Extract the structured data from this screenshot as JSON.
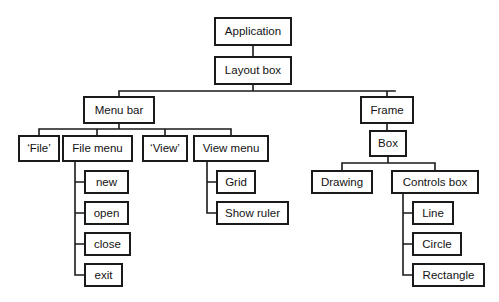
{
  "diagram": {
    "type": "tree-diagram",
    "style": {
      "background": "#ffffff",
      "box_fill": "#ffffff",
      "box_stroke": "#1a1a1a",
      "text_color": "#121212",
      "connector_color": "#1a1a1a"
    },
    "nodes": [
      {
        "id": "application",
        "label": "Application",
        "x": 215,
        "y": 18,
        "w": 76,
        "h": 27
      },
      {
        "id": "layout_box",
        "label": "Layout box",
        "x": 215,
        "y": 57,
        "w": 76,
        "h": 27
      },
      {
        "id": "menu_bar",
        "label": "Menu bar",
        "x": 84,
        "y": 97,
        "w": 70,
        "h": 26
      },
      {
        "id": "frame",
        "label": "Frame",
        "x": 361,
        "y": 97,
        "w": 52,
        "h": 26
      },
      {
        "id": "file_literal",
        "label": "‘File’",
        "x": 19,
        "y": 136,
        "w": 40,
        "h": 25
      },
      {
        "id": "file_menu",
        "label": "File menu",
        "x": 63,
        "y": 136,
        "w": 69,
        "h": 25
      },
      {
        "id": "view_literal",
        "label": "‘View’",
        "x": 143,
        "y": 136,
        "w": 44,
        "h": 25
      },
      {
        "id": "view_menu",
        "label": "View menu",
        "x": 194,
        "y": 136,
        "w": 74,
        "h": 25
      },
      {
        "id": "box",
        "label": "Box",
        "x": 370,
        "y": 131,
        "w": 36,
        "h": 25
      },
      {
        "id": "new",
        "label": "new",
        "x": 85,
        "y": 171,
        "w": 43,
        "h": 22
      },
      {
        "id": "open",
        "label": "open",
        "x": 85,
        "y": 202,
        "w": 43,
        "h": 22
      },
      {
        "id": "close",
        "label": "close",
        "x": 85,
        "y": 233,
        "w": 45,
        "h": 22
      },
      {
        "id": "exit",
        "label": "exit",
        "x": 85,
        "y": 264,
        "w": 37,
        "h": 22
      },
      {
        "id": "grid",
        "label": "Grid",
        "x": 217,
        "y": 171,
        "w": 38,
        "h": 22
      },
      {
        "id": "show_ruler",
        "label": "Show ruler",
        "x": 217,
        "y": 202,
        "w": 71,
        "h": 22
      },
      {
        "id": "drawing",
        "label": "Drawing",
        "x": 312,
        "y": 171,
        "w": 60,
        "h": 22
      },
      {
        "id": "controls_box",
        "label": "Controls box",
        "x": 392,
        "y": 171,
        "w": 86,
        "h": 22
      },
      {
        "id": "line",
        "label": "Line",
        "x": 413,
        "y": 202,
        "w": 40,
        "h": 22
      },
      {
        "id": "circle",
        "label": "Circle",
        "x": 413,
        "y": 233,
        "w": 48,
        "h": 22
      },
      {
        "id": "rectangle",
        "label": "Rectangle",
        "x": 413,
        "y": 264,
        "w": 71,
        "h": 22
      }
    ],
    "edges": [
      {
        "from": "application",
        "to": "layout_box",
        "kind": "vertical"
      },
      {
        "from": "layout_box",
        "to": "menu_bar",
        "kind": "elbow-down"
      },
      {
        "from": "layout_box",
        "to": "frame",
        "kind": "elbow-down"
      },
      {
        "from": "menu_bar",
        "to": "file_literal",
        "kind": "elbow-down"
      },
      {
        "from": "menu_bar",
        "to": "file_menu",
        "kind": "elbow-down"
      },
      {
        "from": "menu_bar",
        "to": "view_literal",
        "kind": "elbow-down"
      },
      {
        "from": "menu_bar",
        "to": "view_menu",
        "kind": "elbow-down"
      },
      {
        "from": "frame",
        "to": "box",
        "kind": "vertical"
      },
      {
        "from": "box",
        "to": "drawing",
        "kind": "elbow-down"
      },
      {
        "from": "box",
        "to": "controls_box",
        "kind": "elbow-down"
      },
      {
        "from": "file_menu",
        "to": "new",
        "kind": "elbow-side"
      },
      {
        "from": "file_menu",
        "to": "open",
        "kind": "elbow-side"
      },
      {
        "from": "file_menu",
        "to": "close",
        "kind": "elbow-side"
      },
      {
        "from": "file_menu",
        "to": "exit",
        "kind": "elbow-side"
      },
      {
        "from": "view_menu",
        "to": "grid",
        "kind": "elbow-side"
      },
      {
        "from": "view_menu",
        "to": "show_ruler",
        "kind": "elbow-side"
      },
      {
        "from": "controls_box",
        "to": "line",
        "kind": "elbow-side"
      },
      {
        "from": "controls_box",
        "to": "circle",
        "kind": "elbow-side"
      },
      {
        "from": "controls_box",
        "to": "rectangle",
        "kind": "elbow-side"
      }
    ],
    "connector_paths": [
      "M 253 45 L 253 57",
      "M 253 84 L 253 91 M 119 91 L 395 91 M 119 91 L 119 97 M 387 91 L 387 97",
      "M 119 123 L 119 129 M 39 129 L 231 129 M 39 129 L 39 136 M 97 129 L 97 136 M 165 129 L 165 136 M 231 129 L 231 136",
      "M 387 123 L 387 131",
      "M 388 156 L 388 163 M 342 163 L 435 163 M 342 163 L 342 171 M 435 163 L 435 171",
      "M 75 161 L 75 275 M 75 182 L 85 182 M 75 213 L 85 213 M 75 244 L 85 244 M 75 275 L 85 275",
      "M 207 161 L 207 213 M 207 182 L 217 182 M 207 213 L 217 213",
      "M 403 193 L 403 275 M 403 213 L 413 213 M 403 244 L 413 244 M 403 275 L 413 275"
    ]
  }
}
